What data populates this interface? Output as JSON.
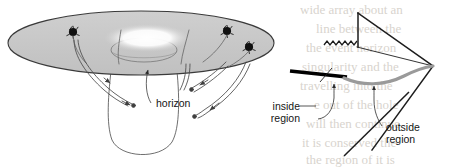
{
  "figure": {
    "panels": [
      {
        "id": "embedding-diagram",
        "name": "curved-spacetime-funnel",
        "labels": [
          {
            "id": "horizon",
            "text": "horizon",
            "x": 156,
            "y": 104
          }
        ],
        "markers": [
          {
            "id": "star-1",
            "x": 73,
            "y": 32
          },
          {
            "id": "star-2",
            "x": 227,
            "y": 31
          },
          {
            "id": "star-3",
            "x": 249,
            "y": 47
          }
        ],
        "colors": {
          "sheet_fill": "#c9c9c9",
          "sheet_stroke": "#3a3a3a",
          "throat_highlight": "#ffffff",
          "worldline": "#4a4a4a",
          "marker": "#111111"
        }
      },
      {
        "id": "penrose-diagram",
        "name": "conformal-diagram",
        "labels": [
          {
            "id": "inside-region",
            "text": "inside",
            "text2": "region",
            "x": 300,
            "y": 110
          },
          {
            "id": "outside-region",
            "text": "outside",
            "text2": "region",
            "x": 384,
            "y": 131
          }
        ],
        "features": [
          {
            "id": "singularity-zigzag",
            "description": "wavy singularity line"
          },
          {
            "id": "event-horizon-diagonal",
            "description": "diagonal null horizon line"
          },
          {
            "id": "slice-thick-black",
            "description": "thick black spacelike slice segment"
          },
          {
            "id": "slice-gray-curve",
            "description": "gray curved slice to right vertex"
          },
          {
            "id": "diamond-outline",
            "description": "conformal boundary outline"
          }
        ],
        "colors": {
          "outline": "#1d1d1d",
          "thick_slice": "#000000",
          "gray_slice": "#9a9a9a",
          "leader": "#2b2b2b"
        }
      }
    ],
    "background_text_bleed": [
      {
        "text": "wide array about an",
        "x": 300,
        "y": 14
      },
      {
        "text": "line between the",
        "x": 316,
        "y": 33
      },
      {
        "text": "the event horizon",
        "x": 306,
        "y": 52
      },
      {
        "text": "singularity and the",
        "x": 302,
        "y": 71
      },
      {
        "text": "travelling into the",
        "x": 300,
        "y": 90
      },
      {
        "text": "e out of the hole",
        "x": 314,
        "y": 109
      },
      {
        "text": "will then continue",
        "x": 306,
        "y": 128
      },
      {
        "text": "it is conserved the",
        "x": 302,
        "y": 147
      },
      {
        "text": "the region of it is",
        "x": 306,
        "y": 164
      }
    ]
  }
}
